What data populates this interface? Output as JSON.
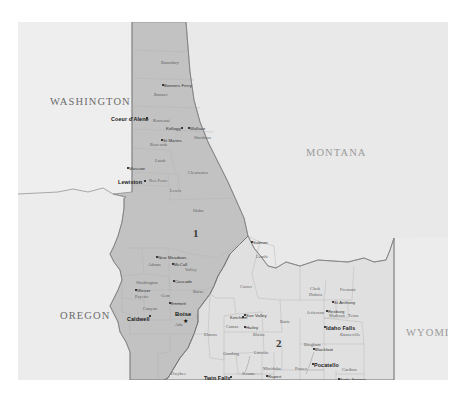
{
  "map": {
    "title": "Idaho Congressional Districts",
    "subject_state": "IDAHO",
    "background_color": "#ebebeb",
    "district1_fill": "#c2c2c2",
    "district2_fill": "#e0e0e0",
    "neighbor_fill": "#e8e8e8",
    "border_color": "#8a8a8a",
    "districts": [
      {
        "number": "1",
        "x": 175,
        "y": 205
      },
      {
        "number": "2",
        "x": 258,
        "y": 315
      }
    ],
    "states": [
      {
        "name": "WASHINGTON",
        "x": 32,
        "y": 74,
        "dim": false
      },
      {
        "name": "MONTANA",
        "x": 288,
        "y": 125,
        "dim": true
      },
      {
        "name": "OREGON",
        "x": 42,
        "y": 288,
        "dim": false
      },
      {
        "name": "WYOMING",
        "x": 388,
        "y": 305,
        "dim": true
      }
    ],
    "counties": [
      {
        "name": "Boundary",
        "x": 143,
        "y": 38
      },
      {
        "name": "Bonner",
        "x": 136,
        "y": 70
      },
      {
        "name": "Kootenai",
        "x": 135,
        "y": 96
      },
      {
        "name": "Shoshone",
        "x": 176,
        "y": 113
      },
      {
        "name": "Benewah",
        "x": 132,
        "y": 120
      },
      {
        "name": "Latah",
        "x": 137,
        "y": 136
      },
      {
        "name": "Clearwater",
        "x": 170,
        "y": 148
      },
      {
        "name": "Nez Perce",
        "x": 131,
        "y": 156
      },
      {
        "name": "Lewis",
        "x": 152,
        "y": 166
      },
      {
        "name": "Idaho",
        "x": 175,
        "y": 186
      },
      {
        "name": "Adams",
        "x": 130,
        "y": 240
      },
      {
        "name": "Valley",
        "x": 167,
        "y": 245
      },
      {
        "name": "Lemhi",
        "x": 238,
        "y": 232
      },
      {
        "name": "Custer",
        "x": 222,
        "y": 262
      },
      {
        "name": "Washington",
        "x": 118,
        "y": 258
      },
      {
        "name": "Gem",
        "x": 143,
        "y": 271
      },
      {
        "name": "Boise",
        "x": 175,
        "y": 267
      },
      {
        "name": "Payette",
        "x": 117,
        "y": 272
      },
      {
        "name": "Canyon",
        "x": 125,
        "y": 284
      },
      {
        "name": "Ada",
        "x": 157,
        "y": 300
      },
      {
        "name": "Elmore",
        "x": 186,
        "y": 310
      },
      {
        "name": "Owyhee",
        "x": 153,
        "y": 349
      },
      {
        "name": "Camas",
        "x": 208,
        "y": 302
      },
      {
        "name": "Blaine",
        "x": 235,
        "y": 310
      },
      {
        "name": "Butte",
        "x": 262,
        "y": 297
      },
      {
        "name": "Gooding",
        "x": 205,
        "y": 329
      },
      {
        "name": "Lincoln",
        "x": 236,
        "y": 328
      },
      {
        "name": "Jerome",
        "x": 224,
        "y": 349
      },
      {
        "name": "Twin Falls",
        "x": 207,
        "y": 365
      },
      {
        "name": "Minidoka",
        "x": 245,
        "y": 344
      },
      {
        "name": "Cassia",
        "x": 243,
        "y": 369
      },
      {
        "name": "Clark",
        "x": 292,
        "y": 264
      },
      {
        "name": "Dubois",
        "x": 291,
        "y": 270
      },
      {
        "name": "Fremont",
        "x": 322,
        "y": 265
      },
      {
        "name": "Jefferson",
        "x": 289,
        "y": 288
      },
      {
        "name": "Madison",
        "x": 311,
        "y": 291
      },
      {
        "name": "Teton",
        "x": 330,
        "y": 291
      },
      {
        "name": "Bonneville",
        "x": 322,
        "y": 310
      },
      {
        "name": "Bingham",
        "x": 286,
        "y": 320
      },
      {
        "name": "Power",
        "x": 277,
        "y": 344
      },
      {
        "name": "Caribou",
        "x": 324,
        "y": 345
      },
      {
        "name": "Bannock",
        "x": 301,
        "y": 364
      },
      {
        "name": "Bear Lake",
        "x": 330,
        "y": 368
      },
      {
        "name": "Oneida",
        "x": 275,
        "y": 373
      },
      {
        "name": "Franklin",
        "x": 300,
        "y": 375
      }
    ],
    "cities": [
      {
        "name": "Bonners Ferry",
        "x": 146,
        "y": 61,
        "size": "sm",
        "dot": true,
        "dotx": 144,
        "doty": 61
      },
      {
        "name": "Coeur d'Alene",
        "x": 93,
        "y": 94,
        "size": "md",
        "dot": true,
        "dotx": 128,
        "doty": 94
      },
      {
        "name": "Kellogg",
        "x": 148,
        "y": 104,
        "size": "sm",
        "dot": true,
        "dotx": 163,
        "doty": 104
      },
      {
        "name": "Wallace",
        "x": 172,
        "y": 104,
        "size": "sm",
        "dot": true,
        "dotx": 170,
        "doty": 104
      },
      {
        "name": "St Maries",
        "x": 145,
        "y": 116,
        "size": "sm",
        "dot": true,
        "dotx": 143,
        "doty": 116
      },
      {
        "name": "Moscow",
        "x": 111,
        "y": 144,
        "size": "sm",
        "dot": true,
        "dotx": 109,
        "doty": 144
      },
      {
        "name": "Lewiston",
        "x": 100,
        "y": 157,
        "size": "md",
        "dot": true,
        "dotx": 126,
        "doty": 157
      },
      {
        "name": "New Meadows",
        "x": 140,
        "y": 233,
        "size": "sm",
        "dot": true,
        "dotx": 138,
        "doty": 233
      },
      {
        "name": "McCall",
        "x": 156,
        "y": 240,
        "size": "sm",
        "dot": true,
        "dotx": 154,
        "doty": 240
      },
      {
        "name": "Cascade",
        "x": 157,
        "y": 257,
        "size": "sm",
        "dot": true,
        "dotx": 155,
        "doty": 257
      },
      {
        "name": "Weiser",
        "x": 119,
        "y": 266,
        "size": "sm",
        "dot": true,
        "dotx": 117,
        "doty": 266
      },
      {
        "name": "Emmett",
        "x": 153,
        "y": 279,
        "size": "sm",
        "dot": true,
        "dotx": 151,
        "doty": 279
      },
      {
        "name": "Caldwell",
        "x": 109,
        "y": 294,
        "size": "md",
        "dot": true,
        "dotx": 131,
        "doty": 292
      },
      {
        "name": "Boise",
        "x": 157,
        "y": 289,
        "size": "cap",
        "dot": false,
        "dotx": 0,
        "doty": 0
      },
      {
        "name": "Salmon",
        "x": 235,
        "y": 218,
        "size": "sm",
        "dot": true,
        "dotx": 233,
        "doty": 218
      },
      {
        "name": "Ketchum",
        "x": 212,
        "y": 293,
        "size": "sm",
        "dot": true,
        "dotx": 224,
        "doty": 293
      },
      {
        "name": "Sun Valley",
        "x": 228,
        "y": 291,
        "size": "sm",
        "dot": true,
        "dotx": 226,
        "doty": 291
      },
      {
        "name": "Hailey",
        "x": 228,
        "y": 303,
        "size": "sm",
        "dot": true,
        "dotx": 226,
        "doty": 303
      },
      {
        "name": "Twin Falls",
        "x": 186,
        "y": 353,
        "size": "md",
        "dot": true,
        "dotx": 212,
        "doty": 353
      },
      {
        "name": "Burley",
        "x": 231,
        "y": 357,
        "size": "sm",
        "dot": true,
        "dotx": 229,
        "doty": 357
      },
      {
        "name": "Rupert",
        "x": 250,
        "y": 352,
        "size": "sm",
        "dot": true,
        "dotx": 248,
        "doty": 352
      },
      {
        "name": "St Anthony",
        "x": 316,
        "y": 278,
        "size": "sm",
        "dot": true,
        "dotx": 314,
        "doty": 278
      },
      {
        "name": "Rexburg",
        "x": 310,
        "y": 287,
        "size": "sm",
        "dot": true,
        "dotx": 308,
        "doty": 287
      },
      {
        "name": "Idaho Falls",
        "x": 308,
        "y": 303,
        "size": "md",
        "dot": true,
        "dotx": 306,
        "doty": 303
      },
      {
        "name": "Blackfoot",
        "x": 297,
        "y": 325,
        "size": "sm",
        "dot": true,
        "dotx": 295,
        "doty": 325
      },
      {
        "name": "Pocatello",
        "x": 296,
        "y": 340,
        "size": "md",
        "dot": true,
        "dotx": 294,
        "doty": 340
      },
      {
        "name": "Soda Springs",
        "x": 322,
        "y": 355,
        "size": "sm",
        "dot": true,
        "dotx": 320,
        "doty": 355
      },
      {
        "name": "Preston",
        "x": 302,
        "y": 381,
        "size": "sm",
        "dot": true,
        "dotx": 314,
        "doty": 381
      }
    ]
  }
}
